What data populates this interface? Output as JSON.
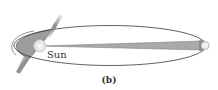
{
  "diagram": {
    "labels": {
      "sun": "Sun",
      "caption": "(b)"
    },
    "colors": {
      "orbit": "#3a3a3a",
      "perihelion_sector": "#9a9a9a",
      "aphelion_sector": "#a8a8a8",
      "sun": "#e6e6e6",
      "planet_blur": "#8c8c8c"
    }
  }
}
